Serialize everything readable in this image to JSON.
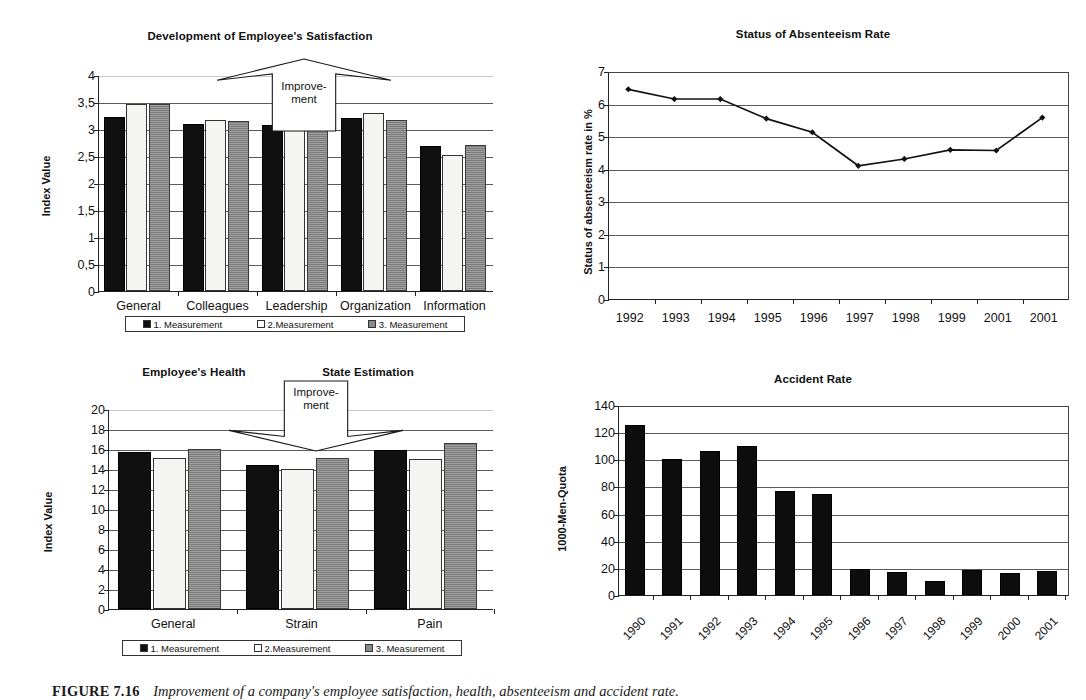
{
  "figure": {
    "caption_label": "FIGURE 7.16",
    "caption_text": "Improvement of a company's employee satisfaction, health, absenteeism and accident rate."
  },
  "charts": {
    "satisfaction": {
      "title": "Development of Employee's Satisfaction",
      "ylabel": "Index Value",
      "annotation": {
        "line1": "Improve-",
        "line2": "ment",
        "direction": "up"
      },
      "legend": [
        "1. Measurement",
        "2.Measurement",
        "3. Measurement"
      ]
    },
    "absenteeism": {
      "title": "Status of Absenteeism Rate",
      "ylabel": "Status of absenteeism rate in %"
    },
    "health": {
      "title_left": "Employee's Health",
      "title_right": "State Estimation",
      "ylabel": "Index Value",
      "annotation": {
        "line1": "Improve-",
        "line2": "ment",
        "direction": "down"
      },
      "legend": [
        "1. Measurement",
        "2.Measurement",
        "3. Measurement"
      ]
    },
    "accident": {
      "title": "Accident Rate",
      "ylabel": "1000-Men-Quota"
    }
  },
  "colors": {
    "series1": "#101010",
    "series2": "#f4f4f2",
    "series3": "#8a8a8a",
    "axis": "#222222",
    "grid": "#5a5a5a"
  },
  "chart_data": [
    {
      "id": "satisfaction",
      "type": "bar",
      "title": "Development of Employee's Satisfaction",
      "xlabel": "",
      "ylabel": "Index Value",
      "ylim": [
        0,
        4
      ],
      "yticks": [
        0,
        0.5,
        1,
        1.5,
        2,
        2.5,
        3,
        3.5,
        4
      ],
      "ytick_labels": [
        "0",
        "0,5",
        "1",
        "1,5",
        "2",
        "2,5",
        "3",
        "3,5",
        "4"
      ],
      "grid": true,
      "legend_position": "bottom",
      "categories": [
        "General",
        "Colleagues",
        "Leadership",
        "Organization",
        "Information"
      ],
      "series": [
        {
          "name": "1. Measurement",
          "values": [
            3.22,
            3.1,
            3.08,
            3.21,
            2.68
          ]
        },
        {
          "name": "2.Measurement",
          "values": [
            3.47,
            3.17,
            3.14,
            3.3,
            2.52
          ]
        },
        {
          "name": "3. Measurement",
          "values": [
            3.47,
            3.14,
            3.08,
            3.17,
            2.7
          ]
        }
      ],
      "annotations": [
        "Improve-ment"
      ]
    },
    {
      "id": "absenteeism",
      "type": "line",
      "title": "Status of Absenteeism Rate",
      "xlabel": "",
      "ylabel": "Status of absenteeism rate in %",
      "ylim": [
        0,
        7
      ],
      "yticks": [
        0,
        1,
        2,
        3,
        4,
        5,
        6,
        7
      ],
      "ytick_labels": [
        "0",
        "1",
        "2",
        "3",
        "4",
        "5",
        "6",
        "7"
      ],
      "grid": true,
      "legend_position": "none",
      "x": [
        "1992",
        "1993",
        "1994",
        "1995",
        "1996",
        "1997",
        "1998",
        "1999",
        "2001",
        "2001"
      ],
      "values": [
        6.47,
        6.17,
        6.17,
        5.57,
        5.15,
        4.12,
        4.33,
        4.61,
        4.59,
        5.6
      ]
    },
    {
      "id": "health",
      "type": "bar",
      "title": "Employee's Health   State Estimation",
      "xlabel": "",
      "ylabel": "Index Value",
      "ylim": [
        0,
        20
      ],
      "yticks": [
        0,
        2,
        4,
        6,
        8,
        10,
        12,
        14,
        16,
        18,
        20
      ],
      "ytick_labels": [
        "0",
        "2",
        "4",
        "6",
        "8",
        "10",
        "12",
        "14",
        "16",
        "18",
        "20"
      ],
      "grid": true,
      "legend_position": "bottom",
      "categories": [
        "General",
        "Strain",
        "Pain"
      ],
      "series": [
        {
          "name": "1. Measurement",
          "values": [
            15.7,
            14.4,
            15.9
          ]
        },
        {
          "name": "2.Measurement",
          "values": [
            15.1,
            14.0,
            15.0
          ]
        },
        {
          "name": "3. Measurement",
          "values": [
            16.0,
            15.1,
            16.6
          ]
        }
      ],
      "annotations": [
        "Improve-ment"
      ]
    },
    {
      "id": "accident",
      "type": "bar",
      "title": "Accident Rate",
      "xlabel": "",
      "ylabel": "1000-Men-Quota",
      "ylim": [
        0,
        140
      ],
      "yticks": [
        0,
        20,
        40,
        60,
        80,
        100,
        120,
        140
      ],
      "ytick_labels": [
        "0",
        "20",
        "40",
        "60",
        "80",
        "100",
        "120",
        "140"
      ],
      "grid": true,
      "legend_position": "none",
      "categories": [
        "1990",
        "1991",
        "1992",
        "1993",
        "1994",
        "1995",
        "1996",
        "1997",
        "1998",
        "1999",
        "2000",
        "2001"
      ],
      "values": [
        125,
        100,
        106,
        109.5,
        76.5,
        74.5,
        19.5,
        17,
        10,
        18.5,
        16.5,
        17.5
      ]
    }
  ]
}
